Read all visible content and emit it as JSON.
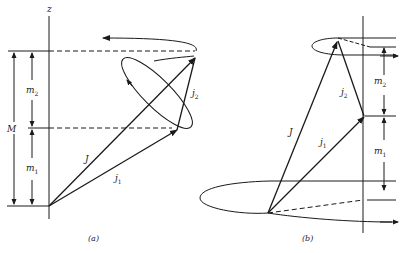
{
  "figure": {
    "panel_a": {
      "caption": "(a)",
      "axis_label": "z",
      "labels": {
        "M": "M",
        "m2_base": "m",
        "m2_sub": "2",
        "m1_base": "m",
        "m1_sub": "1",
        "J": "J",
        "j1_base": "j",
        "j1_sub": "1",
        "j2_base": "j",
        "j2_sub": "2"
      }
    },
    "panel_b": {
      "caption": "(b)",
      "labels": {
        "m2_base": "m",
        "m2_sub": "2",
        "m1_base": "m",
        "m1_sub": "1",
        "J": "J",
        "j1_base": "j",
        "j1_sub": "1",
        "j2_base": "j",
        "j2_sub": "2"
      }
    }
  },
  "colors": {
    "ink": "#1a1a1a",
    "background": "#ffffff"
  }
}
